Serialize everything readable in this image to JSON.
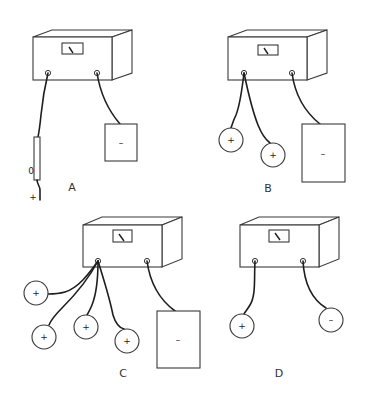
{
  "diagram": {
    "panels": [
      {
        "id": "A",
        "label": "A",
        "left_terminal": [
          "rod with plus charge"
        ],
        "rod_sign": "+",
        "right_terminal": [
          "negative plate"
        ],
        "plate_sign": "–"
      },
      {
        "id": "B",
        "label": "B",
        "left_terminal": [
          "positive sphere",
          "positive sphere"
        ],
        "sphere_signs": [
          "+",
          "+"
        ],
        "right_terminal": [
          "negative plate"
        ],
        "plate_sign": "–"
      },
      {
        "id": "C",
        "label": "C",
        "left_terminal": [
          "positive sphere",
          "positive sphere",
          "positive sphere",
          "positive sphere"
        ],
        "sphere_signs": [
          "+",
          "+",
          "+",
          "+"
        ],
        "right_terminal": [
          "negative plate"
        ],
        "plate_sign": "–"
      },
      {
        "id": "D",
        "label": "D",
        "left_terminal": [
          "positive sphere"
        ],
        "sphere_signs": [
          "+"
        ],
        "right_terminal": [
          "negative sphere"
        ],
        "negative_sphere_sign": "–"
      }
    ],
    "colors": {
      "background": "#ffffff",
      "line": "#3a3a3a",
      "wire": "#1e1e1e"
    }
  }
}
